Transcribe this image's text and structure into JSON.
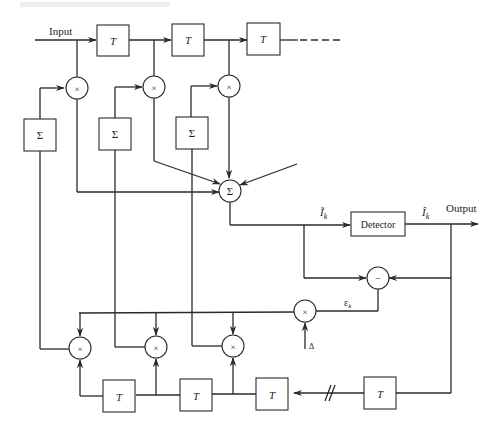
{
  "diagram": {
    "type": "block-diagram",
    "labels": {
      "input": "Input",
      "output": "Output",
      "detector": "Detector",
      "delay": "T",
      "summer": "Σ",
      "multiplier": "×",
      "subtractor": "−",
      "equalizer_out": "Ĩ",
      "equalizer_out_sub": "k",
      "decision": "Î",
      "decision_sub": "k",
      "error": "ε",
      "error_sub": "k",
      "step_size": "Δ"
    },
    "top_delay_line": {
      "delays": [
        "T",
        "T",
        "T"
      ],
      "continuation": "dashed"
    },
    "tap_multipliers": [
      "×",
      "×",
      "×"
    ],
    "integrators": [
      "Σ",
      "Σ",
      "Σ"
    ],
    "bottom_delay_line": {
      "delays": [
        "T",
        "T",
        "T",
        "T"
      ],
      "break_marker": "//"
    },
    "correlator_multipliers": [
      "×",
      "×",
      "×"
    ]
  }
}
